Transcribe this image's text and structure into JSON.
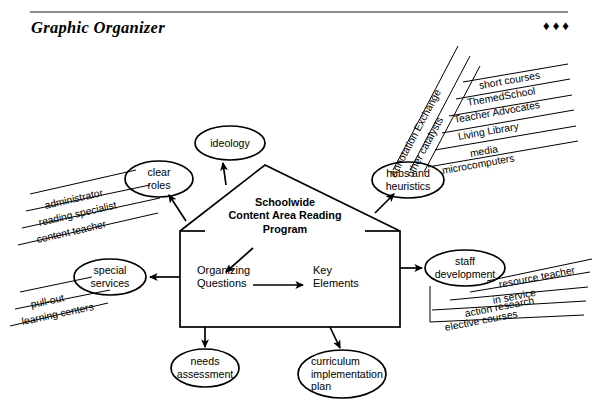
{
  "header": {
    "title": "Graphic Organizer",
    "ornament": "♦♦♦"
  },
  "diagram": {
    "center": {
      "title_line1": "Schoolwide",
      "title_line2": "Content Area Reading",
      "title_line3": "Program",
      "inner_left": "Organizing\nQuestions",
      "inner_left_line1": "Organizing",
      "inner_left_line2": "Questions",
      "inner_right_line1": "Key",
      "inner_right_line2": "Elements"
    },
    "nodes": [
      {
        "id": "ideology",
        "line1": "ideology",
        "line2": ""
      },
      {
        "id": "clear-roles",
        "line1": "clear",
        "line2": "roles"
      },
      {
        "id": "hubs-heuristics",
        "line1": "hubs and",
        "line2": "heuristics"
      },
      {
        "id": "special-services",
        "line1": "special",
        "line2": "services"
      },
      {
        "id": "staff-development",
        "line1": "staff",
        "line2": "development"
      },
      {
        "id": "needs-assessment",
        "line1": "needs",
        "line2": "assessment"
      },
      {
        "id": "curriculum-plan",
        "line1": "curriculum",
        "line2": "implementation",
        "line3": "plan"
      }
    ],
    "fans": {
      "clear_roles": [
        "administrator",
        "reading specialist",
        "content teacher"
      ],
      "special_services": [
        "pull-out",
        "learning centers"
      ],
      "hubs_steep": [
        "Annotation Exchange",
        "other catalysts"
      ],
      "hubs_items": [
        "short courses",
        "ThemedSchool",
        "Teacher Advocates",
        "Living Library",
        "media",
        "microcomputers"
      ],
      "staff_development": [
        "resource teacher",
        "in service",
        "action research",
        "elective courses"
      ]
    }
  }
}
